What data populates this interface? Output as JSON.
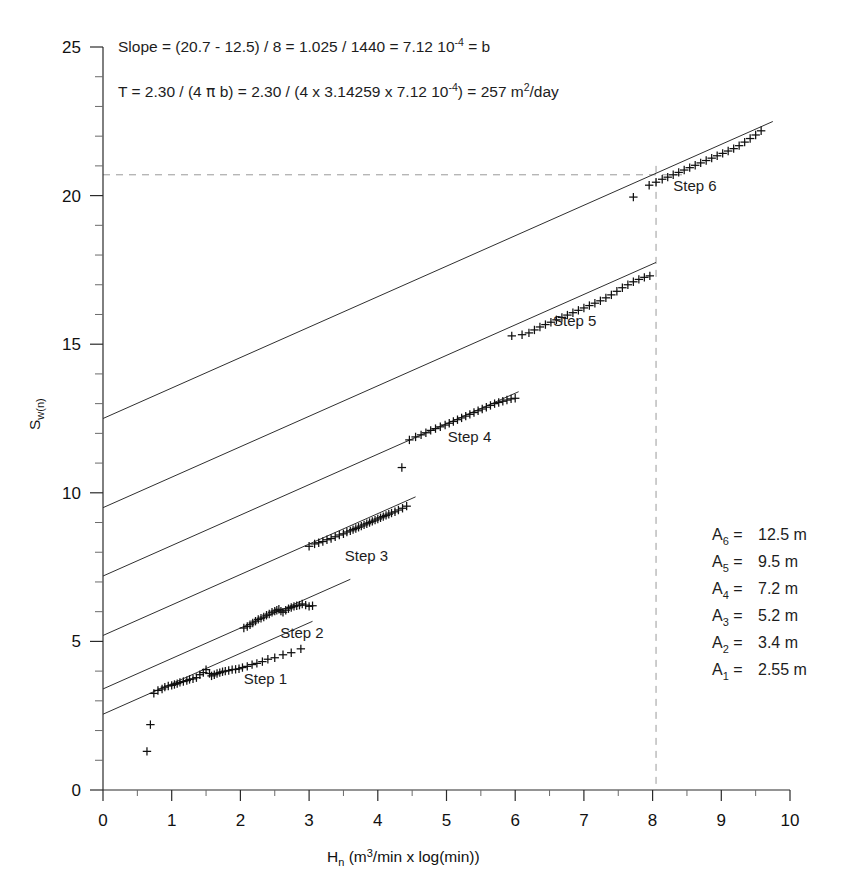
{
  "chart_data": {
    "type": "scatter",
    "title": "",
    "xlabel": "Hn (m3/min x log(min))",
    "ylabel": "Sw(n)",
    "xlim": [
      0,
      10
    ],
    "ylim": [
      0,
      25
    ],
    "x_ticks": [
      0,
      1,
      2,
      3,
      4,
      5,
      6,
      7,
      8,
      9,
      10
    ],
    "y_ticks": [
      0,
      5,
      10,
      15,
      20,
      25
    ],
    "x_minor_step": 0.5,
    "y_minor_step": 1,
    "grid": false,
    "legend_position": "lower-right",
    "slope_b": 1.025,
    "annotations": [
      "Slope = (20.7 - 12.5) / 8 = 1.025 / 1440 = 7.12 10-4 = b",
      "T = 2.30 / (4 pi b) = 2.30 / (4 x 3.14259 x 7.12 10-4) = 257 m2/day"
    ],
    "guides": [
      {
        "type": "horizontal",
        "value": 20.7
      },
      {
        "type": "vertical",
        "value": 8.05
      }
    ],
    "series": [
      {
        "name": "Step 1",
        "intercept": 2.55,
        "slope": 1.025,
        "line_x": [
          0.0,
          3.05
        ],
        "label_x": 2.05,
        "label_y": 3.55,
        "points_x": [
          0.64,
          0.69,
          0.74,
          0.8,
          0.86,
          0.9,
          0.95,
          1.0,
          1.04,
          1.08,
          1.12,
          1.17,
          1.22,
          1.26,
          1.31,
          1.36,
          1.41,
          1.46,
          1.5,
          1.55,
          1.58,
          1.62,
          1.66,
          1.7,
          1.74,
          1.78,
          1.83,
          1.88,
          1.93,
          1.98,
          2.03,
          2.1,
          2.17,
          2.24,
          2.32,
          2.4,
          2.5,
          2.62,
          2.74,
          2.88
        ],
        "points_y": [
          1.3,
          2.2,
          3.25,
          3.35,
          3.4,
          3.46,
          3.5,
          3.52,
          3.55,
          3.58,
          3.62,
          3.65,
          3.68,
          3.72,
          3.74,
          3.78,
          3.88,
          3.95,
          4.05,
          3.92,
          3.84,
          3.88,
          3.92,
          3.95,
          3.98,
          4.0,
          4.02,
          4.05,
          4.06,
          4.08,
          4.12,
          4.16,
          4.22,
          4.26,
          4.32,
          4.4,
          4.45,
          4.55,
          4.62,
          4.75
        ]
      },
      {
        "name": "Step 2",
        "intercept": 3.4,
        "slope": 1.025,
        "line_x": [
          0.0,
          3.6
        ],
        "label_x": 2.58,
        "label_y": 5.1,
        "points_x": [
          2.05,
          2.1,
          2.14,
          2.18,
          2.22,
          2.26,
          2.3,
          2.34,
          2.38,
          2.42,
          2.46,
          2.5,
          2.53,
          2.56,
          2.59,
          2.62,
          2.66,
          2.7,
          2.74,
          2.78,
          2.82,
          2.86,
          2.9,
          2.95,
          3.0,
          3.05
        ],
        "points_y": [
          5.45,
          5.5,
          5.56,
          5.62,
          5.68,
          5.74,
          5.78,
          5.82,
          5.88,
          5.92,
          5.98,
          6.02,
          6.05,
          6.08,
          6.02,
          5.98,
          6.05,
          6.1,
          6.14,
          6.18,
          6.2,
          6.22,
          6.26,
          6.22,
          6.18,
          6.2
        ]
      },
      {
        "name": "Step 3",
        "intercept": 5.2,
        "slope": 1.025,
        "line_x": [
          0.0,
          4.55
        ],
        "label_x": 3.52,
        "label_y": 7.7,
        "points_x": [
          3.0,
          3.08,
          3.14,
          3.2,
          3.26,
          3.32,
          3.38,
          3.44,
          3.5,
          3.55,
          3.6,
          3.64,
          3.68,
          3.72,
          3.76,
          3.8,
          3.84,
          3.88,
          3.92,
          3.96,
          4.0,
          4.04,
          4.08,
          4.12,
          4.16,
          4.2,
          4.25,
          4.3,
          4.36,
          4.42
        ],
        "points_y": [
          8.2,
          8.28,
          8.32,
          8.36,
          8.42,
          8.46,
          8.52,
          8.58,
          8.62,
          8.68,
          8.72,
          8.76,
          8.8,
          8.84,
          8.88,
          8.92,
          8.96,
          9.0,
          9.04,
          9.08,
          9.12,
          9.16,
          9.2,
          9.24,
          9.28,
          9.32,
          9.36,
          9.42,
          9.48,
          9.55
        ]
      },
      {
        "name": "Step 4",
        "intercept": 7.2,
        "slope": 1.025,
        "line_x": [
          0.0,
          6.05
        ],
        "label_x": 5.02,
        "label_y": 11.7,
        "points_x": [
          4.35,
          4.46,
          4.55,
          4.63,
          4.7,
          4.77,
          4.84,
          4.91,
          4.98,
          5.04,
          5.1,
          5.16,
          5.22,
          5.28,
          5.34,
          5.4,
          5.46,
          5.52,
          5.58,
          5.64,
          5.7,
          5.76,
          5.82,
          5.88,
          5.94,
          6.0
        ],
        "points_y": [
          10.85,
          11.78,
          11.88,
          11.95,
          12.02,
          12.1,
          12.16,
          12.22,
          12.28,
          12.34,
          12.4,
          12.46,
          12.52,
          12.58,
          12.64,
          12.7,
          12.76,
          12.82,
          12.88,
          12.94,
          13.0,
          13.04,
          13.08,
          13.12,
          13.16,
          13.18
        ]
      },
      {
        "name": "Step 5",
        "intercept": 9.5,
        "slope": 1.025,
        "line_x": [
          0.0,
          8.05
        ],
        "label_x": 6.55,
        "label_y": 15.6,
        "points_x": [
          5.95,
          6.1,
          6.2,
          6.28,
          6.36,
          6.44,
          6.52,
          6.6,
          6.68,
          6.76,
          6.84,
          6.92,
          7.0,
          7.08,
          7.16,
          7.24,
          7.32,
          7.4,
          7.48,
          7.56,
          7.64,
          7.72,
          7.8,
          7.88,
          7.96
        ],
        "points_y": [
          15.28,
          15.32,
          15.38,
          15.48,
          15.58,
          15.66,
          15.74,
          15.82,
          15.9,
          15.98,
          16.06,
          16.14,
          16.22,
          16.3,
          16.38,
          16.46,
          16.56,
          16.66,
          16.78,
          16.9,
          17.0,
          17.1,
          17.18,
          17.25,
          17.3
        ]
      },
      {
        "name": "Step 6",
        "intercept": 12.5,
        "slope": 1.025,
        "line_x": [
          0.0,
          9.75
        ],
        "label_x": 8.3,
        "label_y": 20.15,
        "points_x": [
          7.72,
          7.95,
          8.05,
          8.14,
          8.22,
          8.3,
          8.38,
          8.46,
          8.54,
          8.62,
          8.7,
          8.78,
          8.86,
          8.94,
          9.02,
          9.1,
          9.18,
          9.26,
          9.34,
          9.42,
          9.5,
          9.58
        ],
        "points_y": [
          19.95,
          20.35,
          20.45,
          20.55,
          20.62,
          20.7,
          20.78,
          20.86,
          20.94,
          21.02,
          21.1,
          21.18,
          21.26,
          21.34,
          21.42,
          21.5,
          21.58,
          21.68,
          21.8,
          21.92,
          22.04,
          22.18
        ]
      }
    ]
  },
  "equations": {
    "line1": {
      "part1": "Slope = (20.7 - 12.5) / 8 = 1.025 / 1440  = 7.12 10",
      "sup1": "-4",
      "part2": " = b"
    },
    "line2": {
      "part1": "T = 2.30 / (4 ",
      "pi": "π",
      "part2": " b) = 2.30 / (4 x 3.14259 x 7.12 10",
      "sup1": "-4",
      "part3": ") = 257 m",
      "sup2": "2",
      "part4": "/day"
    }
  },
  "axes": {
    "y_title_main": "S",
    "y_title_sub": "w(n)",
    "x_title_main": "H",
    "x_title_sub": "n",
    "x_title_units_a": "  (m",
    "x_title_units_sup": "3",
    "x_title_units_b": "/min x log(min))",
    "x_tick_labels": [
      "0",
      "1",
      "2",
      "3",
      "4",
      "5",
      "6",
      "7",
      "8",
      "9",
      "10"
    ],
    "y_tick_labels": [
      "0",
      "5",
      "10",
      "15",
      "20",
      "25"
    ]
  },
  "step_labels": [
    "Step 1",
    "Step 2",
    "Step 3",
    "Step 4",
    "Step 5",
    "Step 6"
  ],
  "legend": {
    "rows": [
      {
        "symbol": "A",
        "sub": "6",
        "eq": "=",
        "value": "12.5 m"
      },
      {
        "symbol": "A",
        "sub": "5",
        "eq": "=",
        "value": "9.5 m"
      },
      {
        "symbol": "A",
        "sub": "4",
        "eq": "=",
        "value": "7.2 m"
      },
      {
        "symbol": "A",
        "sub": "3",
        "eq": "=",
        "value": "5.2 m"
      },
      {
        "symbol": "A",
        "sub": "2",
        "eq": "=",
        "value": "3.4 m"
      },
      {
        "symbol": "A",
        "sub": "1",
        "eq": "=",
        "value": "2.55 m"
      }
    ]
  },
  "colors": {
    "ink": "#1a1a1a",
    "axis": "#2a2a2a",
    "guide": "#9a9a9a",
    "line": "#2f2f2f",
    "background": "#ffffff"
  }
}
